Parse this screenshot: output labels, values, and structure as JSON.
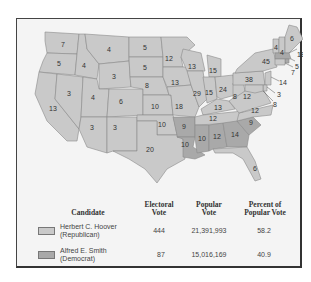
{
  "colors": {
    "republican": "#c9c9c9",
    "democrat": "#a9a9a9",
    "state_border": "#8a8a8a",
    "frame_bg": "#f4f4f4",
    "water": "#f4f4f4"
  },
  "map": {
    "states": [
      {
        "name": "WA",
        "votes": "7",
        "party": "R"
      },
      {
        "name": "OR",
        "votes": "5",
        "party": "R"
      },
      {
        "name": "CA",
        "votes": "13",
        "party": "R"
      },
      {
        "name": "ID",
        "votes": "4",
        "party": "R"
      },
      {
        "name": "NV",
        "votes": "3",
        "party": "R"
      },
      {
        "name": "MT",
        "votes": "4",
        "party": "R"
      },
      {
        "name": "WY",
        "votes": "3",
        "party": "R"
      },
      {
        "name": "UT",
        "votes": "4",
        "party": "R"
      },
      {
        "name": "CO",
        "votes": "6",
        "party": "R"
      },
      {
        "name": "AZ",
        "votes": "3",
        "party": "R"
      },
      {
        "name": "NM",
        "votes": "3",
        "party": "R"
      },
      {
        "name": "ND",
        "votes": "5",
        "party": "R"
      },
      {
        "name": "SD",
        "votes": "5",
        "party": "R"
      },
      {
        "name": "NE",
        "votes": "8",
        "party": "R"
      },
      {
        "name": "KS",
        "votes": "10",
        "party": "R"
      },
      {
        "name": "OK",
        "votes": "10",
        "party": "R"
      },
      {
        "name": "TX",
        "votes": "20",
        "party": "R"
      },
      {
        "name": "MN",
        "votes": "12",
        "party": "R"
      },
      {
        "name": "IA",
        "votes": "13",
        "party": "R"
      },
      {
        "name": "MO",
        "votes": "18",
        "party": "R"
      },
      {
        "name": "AR",
        "votes": "9",
        "party": "D"
      },
      {
        "name": "LA",
        "votes": "10",
        "party": "D"
      },
      {
        "name": "WI",
        "votes": "13",
        "party": "R"
      },
      {
        "name": "IL",
        "votes": "29",
        "party": "R"
      },
      {
        "name": "MI",
        "votes": "15",
        "party": "R"
      },
      {
        "name": "IN",
        "votes": "15",
        "party": "R"
      },
      {
        "name": "OH",
        "votes": "24",
        "party": "R"
      },
      {
        "name": "KY",
        "votes": "13",
        "party": "R"
      },
      {
        "name": "TN",
        "votes": "12",
        "party": "R"
      },
      {
        "name": "MS",
        "votes": "10",
        "party": "D"
      },
      {
        "name": "AL",
        "votes": "12",
        "party": "D"
      },
      {
        "name": "GA",
        "votes": "14",
        "party": "D"
      },
      {
        "name": "FL",
        "votes": "6",
        "party": "R"
      },
      {
        "name": "SC",
        "votes": "9",
        "party": "D"
      },
      {
        "name": "NC",
        "votes": "12",
        "party": "R"
      },
      {
        "name": "VA",
        "votes": "12",
        "party": "R"
      },
      {
        "name": "WV",
        "votes": "8",
        "party": "R"
      },
      {
        "name": "PA",
        "votes": "38",
        "party": "R"
      },
      {
        "name": "NY",
        "votes": "45",
        "party": "R"
      },
      {
        "name": "VT",
        "votes": "4",
        "party": "R"
      },
      {
        "name": "NH",
        "votes": "4",
        "party": "R"
      },
      {
        "name": "ME",
        "votes": "6",
        "party": "R"
      },
      {
        "name": "MA",
        "votes": "18",
        "party": "D"
      },
      {
        "name": "RI",
        "votes": "5",
        "party": "D"
      },
      {
        "name": "CT",
        "votes": "7",
        "party": "R"
      },
      {
        "name": "NJ",
        "votes": "14",
        "party": "R"
      },
      {
        "name": "DE",
        "votes": "3",
        "party": "R"
      },
      {
        "name": "MD",
        "votes": "8",
        "party": "R"
      }
    ]
  },
  "legend": {
    "headers": {
      "candidate": "Candidate",
      "electoral_1": "Electoral",
      "electoral_2": "Vote",
      "popular_1": "Popular",
      "popular_2": "Vote",
      "percent_1": "Percent of",
      "percent_2": "Popular Vote"
    },
    "rows": [
      {
        "name": "Herbert C. Hoover",
        "party": "(Republican)",
        "electoral": "444",
        "popular": "21,391,993",
        "percent": "58.2",
        "color": "#c9c9c9"
      },
      {
        "name": "Alfred E. Smith",
        "party": "(Democrat)",
        "electoral": "87",
        "popular": "15,016,169",
        "percent": "40.9",
        "color": "#a9a9a9"
      }
    ]
  }
}
